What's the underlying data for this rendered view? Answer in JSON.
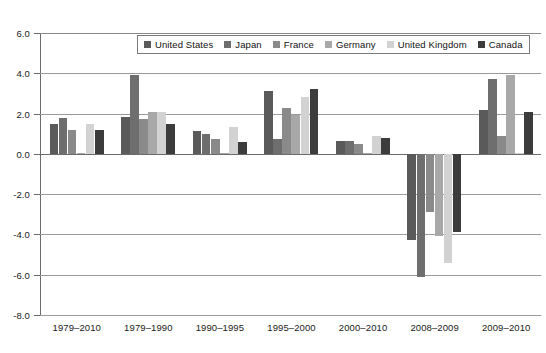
{
  "chart_data": {
    "type": "bar",
    "title": "",
    "xlabel": "",
    "ylabel": "",
    "ylim": [
      -8.0,
      6.0
    ],
    "ytick_step": 2.0,
    "grid": true,
    "legend_position": "top-center",
    "ytick_labels": [
      "6.0",
      "4.0",
      "2.0",
      "0.0",
      "-2.0",
      "-4.0",
      "-6.0",
      "-8.0"
    ],
    "ytick_values": [
      6.0,
      4.0,
      2.0,
      0.0,
      -2.0,
      -4.0,
      -6.0,
      -8.0
    ],
    "categories": [
      "1979–2010",
      "1979–1990",
      "1990–1995",
      "1995–2000",
      "2000–2010",
      "2008–2009",
      "2009–2010"
    ],
    "series": [
      {
        "name": "United States",
        "color": "#5a5a5a",
        "values": [
          1.5,
          1.85,
          1.15,
          3.1,
          0.65,
          -4.3,
          2.2
        ]
      },
      {
        "name": "Japan",
        "color": "#6e6e6e",
        "values": [
          1.8,
          3.9,
          1.0,
          0.75,
          0.65,
          -6.1,
          3.7
        ]
      },
      {
        "name": "France",
        "color": "#8a8a8a",
        "values": [
          1.2,
          1.75,
          0.75,
          2.3,
          0.5,
          -2.9,
          0.9
        ]
      },
      {
        "name": "Germany",
        "color": "#a8a8a8",
        "values": [
          0.05,
          2.1,
          0.05,
          1.95,
          0.05,
          -4.1,
          3.9
        ]
      },
      {
        "name": "United Kingdom",
        "color": "#d2d2d2",
        "values": [
          1.5,
          2.1,
          1.35,
          2.8,
          0.9,
          -5.4,
          0.05
        ]
      },
      {
        "name": "Canada",
        "color": "#3c3c3c",
        "values": [
          1.2,
          1.5,
          0.6,
          3.2,
          0.8,
          -3.9,
          2.1
        ]
      }
    ]
  }
}
